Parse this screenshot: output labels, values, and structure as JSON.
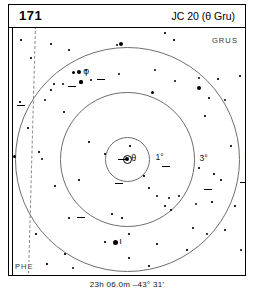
{
  "header": {
    "page_number": "171",
    "object_title": "JC 20 (θ Gru)"
  },
  "chart": {
    "constellation_labels": [
      {
        "name": "GRUS",
        "position": "top-right"
      },
      {
        "name": "PHE",
        "position": "bottom-left"
      }
    ],
    "center_star_label": "θ",
    "radius_labels": [
      "1°",
      "3°",
      "5°"
    ],
    "named_stars": [
      {
        "label": "θ",
        "note": "theta Gruis, chart centre, double star"
      },
      {
        "label": "ι",
        "note": "iota Gruis"
      },
      {
        "label": "φ",
        "note": "phi Gruis"
      }
    ],
    "boundary_note": "dashed constellation boundary Grus / Phoenix"
  },
  "footer": {
    "coordinates": "23h 06.0m  –43° 31'"
  },
  "colors": {
    "ink": "#000000",
    "circle": "#6e6e6e",
    "boundary": "#8a8a8a",
    "background": "#ffffff"
  },
  "chart_data": {
    "type": "scatter",
    "title": "JC 20 (θ Gru)",
    "subtitle": "23h 06.0m  –43° 31'",
    "xlabel": "",
    "ylabel": "",
    "projection": "finder chart, field centred on θ Gruis",
    "grid": false,
    "legend": null,
    "annotations": [
      "1°",
      "3°",
      "5°",
      "GRUS",
      "PHE",
      "θ",
      "ι",
      "φ"
    ],
    "field_circles_deg": [
      1,
      3,
      5
    ],
    "stars": [
      {
        "x": 42,
        "y": 16,
        "mag": 1.6
      },
      {
        "x": 60,
        "y": 22,
        "mag": 1.4
      },
      {
        "x": 22,
        "y": 30,
        "mag": 1.5
      },
      {
        "x": 108,
        "y": 17,
        "mag": 2.4
      },
      {
        "x": 156,
        "y": 5,
        "mag": 1.5
      },
      {
        "x": 165,
        "y": 12,
        "mag": 1.4
      },
      {
        "x": 12,
        "y": 12,
        "mag": 1.3
      },
      {
        "x": 64,
        "y": 44,
        "mag": 3.0
      },
      {
        "x": 77,
        "y": 42,
        "mag": 2.0
      },
      {
        "x": 110,
        "y": 46,
        "mag": 2.6
      },
      {
        "x": 45,
        "y": 56,
        "mag": 1.6
      },
      {
        "x": 54,
        "y": 56,
        "mag": 2.4
      },
      {
        "x": 72,
        "y": 54,
        "mag": 3.2
      },
      {
        "x": 82,
        "y": 52,
        "mag": 2.6
      },
      {
        "x": 146,
        "y": 42,
        "mag": 2.0
      },
      {
        "x": 166,
        "y": 53,
        "mag": 2.4
      },
      {
        "x": 190,
        "y": 50,
        "mag": 2.2
      },
      {
        "x": 209,
        "y": 51,
        "mag": 1.5
      },
      {
        "x": 231,
        "y": 48,
        "mag": 1.5
      },
      {
        "x": 42,
        "y": 62,
        "mag": 1.3
      },
      {
        "x": 36,
        "y": 72,
        "mag": 2.4
      },
      {
        "x": 143,
        "y": 64,
        "mag": 3.0
      },
      {
        "x": 200,
        "y": 70,
        "mag": 1.6
      },
      {
        "x": 216,
        "y": 72,
        "mag": 2.2
      },
      {
        "x": 240,
        "y": 74,
        "mag": 1.8
      },
      {
        "x": 55,
        "y": 84,
        "mag": 1.4
      },
      {
        "x": 196,
        "y": 88,
        "mag": 1.5
      },
      {
        "x": 11,
        "y": 74,
        "mag": 1.4
      },
      {
        "x": 19,
        "y": 100,
        "mag": 1.3
      },
      {
        "x": 80,
        "y": 114,
        "mag": 1.3
      },
      {
        "x": 121,
        "y": 118,
        "mag": 1.4
      },
      {
        "x": 30,
        "y": 124,
        "mag": 1.4
      },
      {
        "x": 33,
        "y": 131,
        "mag": 2.4
      },
      {
        "x": 5,
        "y": 128,
        "mag": 3.0
      },
      {
        "x": 96,
        "y": 126,
        "mag": 1.6
      },
      {
        "x": 222,
        "y": 118,
        "mag": 1.5
      },
      {
        "x": 190,
        "y": 140,
        "mag": 1.5
      },
      {
        "x": 205,
        "y": 146,
        "mag": 1.4
      },
      {
        "x": 212,
        "y": 152,
        "mag": 1.3
      },
      {
        "x": 70,
        "y": 152,
        "mag": 1.4
      },
      {
        "x": 46,
        "y": 158,
        "mag": 1.4
      },
      {
        "x": 135,
        "y": 148,
        "mag": 1.5
      },
      {
        "x": 140,
        "y": 160,
        "mag": 1.5
      },
      {
        "x": 148,
        "y": 168,
        "mag": 2.6
      },
      {
        "x": 160,
        "y": 170,
        "mag": 1.9
      },
      {
        "x": 170,
        "y": 168,
        "mag": 1.8
      },
      {
        "x": 156,
        "y": 178,
        "mag": 1.4
      },
      {
        "x": 162,
        "y": 182,
        "mag": 1.4
      },
      {
        "x": 187,
        "y": 176,
        "mag": 2.0
      },
      {
        "x": 203,
        "y": 174,
        "mag": 1.4
      },
      {
        "x": 226,
        "y": 178,
        "mag": 1.6
      },
      {
        "x": 103,
        "y": 186,
        "mag": 1.5
      },
      {
        "x": 113,
        "y": 190,
        "mag": 1.4
      },
      {
        "x": 60,
        "y": 190,
        "mag": 1.4
      },
      {
        "x": 120,
        "y": 206,
        "mag": 1.4
      },
      {
        "x": 184,
        "y": 200,
        "mag": 1.5
      },
      {
        "x": 198,
        "y": 206,
        "mag": 2.2
      },
      {
        "x": 216,
        "y": 202,
        "mag": 1.4
      },
      {
        "x": 27,
        "y": 206,
        "mag": 1.3
      },
      {
        "x": 96,
        "y": 214,
        "mag": 1.3
      },
      {
        "x": 148,
        "y": 216,
        "mag": 1.4
      },
      {
        "x": 178,
        "y": 222,
        "mag": 1.4
      },
      {
        "x": 232,
        "y": 222,
        "mag": 2.8
      },
      {
        "x": 56,
        "y": 226,
        "mag": 1.3
      },
      {
        "x": 120,
        "y": 230,
        "mag": 1.4
      },
      {
        "x": 38,
        "y": 236,
        "mag": 1.4
      },
      {
        "x": 64,
        "y": 240,
        "mag": 2.6
      },
      {
        "x": 140,
        "y": 238,
        "mag": 1.4
      }
    ],
    "bright_stars": [
      {
        "x": 112,
        "y": 16,
        "mag": 4.0,
        "label": null
      },
      {
        "x": 70,
        "y": 44,
        "mag": 4.4,
        "label": "φ"
      },
      {
        "x": 190,
        "y": 60,
        "mag": 4.2,
        "label": null
      },
      {
        "x": 106,
        "y": 214,
        "mag": 5.0,
        "label": "ι"
      },
      {
        "x": 118,
        "y": 131,
        "mag": 4.6,
        "label": "θ"
      }
    ]
  }
}
